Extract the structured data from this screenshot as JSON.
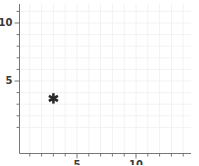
{
  "chart_data": {
    "type": "scatter",
    "title": "",
    "xlabel": "",
    "ylabel": "",
    "xlim": [
      0.55,
      15.0
    ],
    "ylim": [
      0.0,
      11.8
    ],
    "grid": true,
    "grid_color": "#f2f2f2",
    "axis_color": "#777777",
    "marker_color": "#2b2b2b",
    "marker_symbol": "asterisk",
    "legend": null,
    "x_ticks_major": [
      5,
      10
    ],
    "y_ticks_major": [
      5,
      10
    ],
    "x_tick_labels": [
      "5",
      "10"
    ],
    "y_tick_labels": [
      "5",
      "10"
    ],
    "x_minor_step": 1,
    "y_minor_step": 1,
    "series": [
      {
        "name": "series-1",
        "marker": "asterisk",
        "points": [
          {
            "x": 3,
            "y": 3.5
          }
        ]
      }
    ]
  },
  "axes": {
    "y_label_10": "10",
    "y_label_5": "5",
    "x_label_5": "5",
    "x_label_10": "10"
  }
}
